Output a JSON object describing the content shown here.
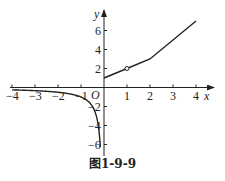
{
  "chart_data": {
    "type": "line",
    "title": "",
    "caption": "图1-9-9",
    "xlabel": "x",
    "ylabel": "y",
    "origin_label": "O",
    "xlim": [
      -4,
      4
    ],
    "ylim": [
      -7,
      7
    ],
    "grid": false,
    "x_ticks": [
      -4,
      -3,
      -2,
      -1,
      1,
      2,
      3,
      4
    ],
    "x_tick_labels": [
      "-4",
      "-3",
      "-2",
      "-1",
      "1",
      "2",
      "3",
      "4"
    ],
    "y_ticks": [
      -6,
      -4,
      -2,
      2,
      4,
      6
    ],
    "y_tick_labels": [
      "-6",
      "-4",
      "-2",
      "2",
      "4",
      "6"
    ],
    "series": [
      {
        "name": "left-branch (x<0, curve approaching -∞ near x=0)",
        "x": [
          -4,
          -3,
          -2,
          -1,
          -0.5,
          -0.25,
          -0.15
        ],
        "y": [
          -0.25,
          -0.33,
          -0.5,
          -1,
          -2,
          -4,
          -7
        ]
      },
      {
        "name": "right-branch (piecewise linear, x≥0)",
        "x": [
          0,
          1,
          2,
          4
        ],
        "y": [
          1,
          2,
          3,
          7
        ]
      }
    ],
    "annotations": [
      {
        "type": "open-circle",
        "x": 1,
        "y": 2
      }
    ]
  },
  "figure": {
    "caption": "图1-9-9"
  }
}
